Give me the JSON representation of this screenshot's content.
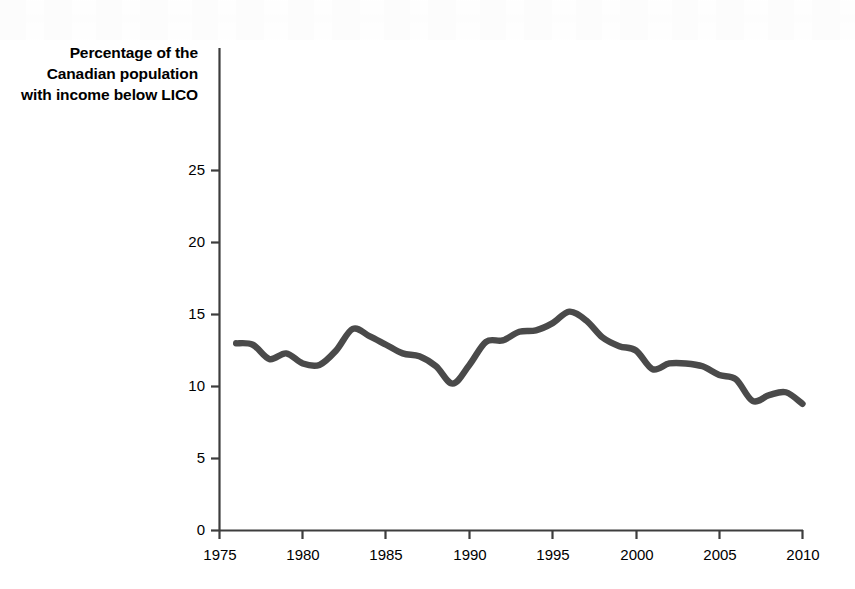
{
  "figure": {
    "name": "lico-line-chart",
    "background_color": "#ffffff",
    "axis_color": "#3d3d3d",
    "line_color": "#4a4a4a",
    "text_color": "#000000"
  },
  "chart_data": {
    "type": "line",
    "title": "",
    "ylabel_lines": [
      "Percentage of the",
      "Canadian population",
      "with income below LICO"
    ],
    "ylabel": "Percentage of the Canadian population with income below LICO",
    "xlabel": "",
    "xlim": [
      1975,
      2010
    ],
    "ylim": [
      0,
      27
    ],
    "grid": false,
    "legend": null,
    "xticks": [
      1975,
      1980,
      1985,
      1990,
      1995,
      2000,
      2005,
      2010
    ],
    "xtick_labels": [
      "1975",
      "1980",
      "1985",
      "1990",
      "1995",
      "2000",
      "2005",
      "2010"
    ],
    "yticks": [
      0,
      5,
      10,
      15,
      20,
      25
    ],
    "ytick_labels": [
      "0",
      "5",
      "10",
      "15",
      "20",
      "25"
    ],
    "series": [
      {
        "name": "Percentage of the Canadian population with income below LICO",
        "color": "#4a4a4a",
        "x": [
          1976,
          1977,
          1978,
          1979,
          1980,
          1981,
          1982,
          1983,
          1984,
          1985,
          1986,
          1987,
          1988,
          1989,
          1990,
          1991,
          1992,
          1993,
          1994,
          1995,
          1996,
          1997,
          1998,
          1999,
          2000,
          2001,
          2002,
          2003,
          2004,
          2005,
          2006,
          2007,
          2008,
          2009,
          2010
        ],
        "values": [
          13.0,
          12.9,
          11.9,
          12.3,
          11.6,
          11.5,
          12.5,
          14.0,
          13.5,
          12.9,
          12.3,
          12.1,
          11.4,
          10.2,
          11.5,
          13.1,
          13.2,
          13.8,
          13.9,
          14.4,
          15.2,
          14.6,
          13.4,
          12.8,
          12.5,
          11.2,
          11.6,
          11.6,
          11.4,
          10.8,
          10.5,
          9.0,
          9.4,
          9.6,
          8.8
        ]
      }
    ]
  }
}
